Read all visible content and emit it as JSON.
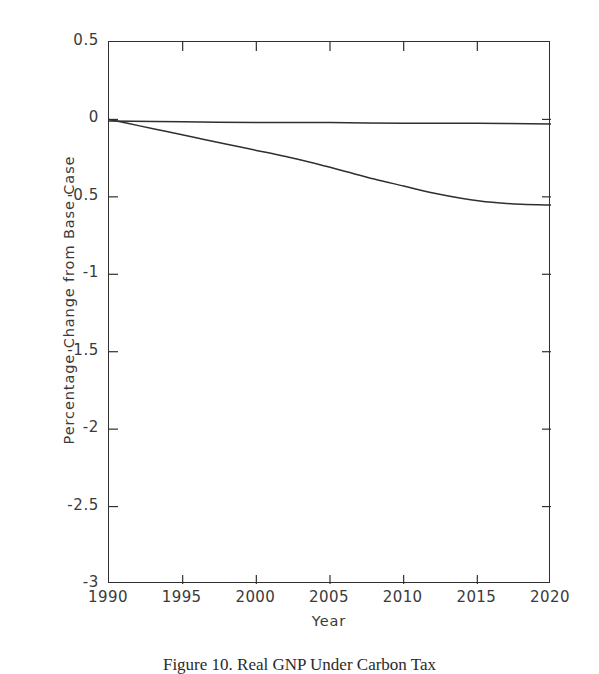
{
  "figure": {
    "caption": "Figure 10.  Real GNP Under Carbon Tax"
  },
  "axes": {
    "xlabel": "Year",
    "ylabel": "Percentage Change from Base Case",
    "xticks": [
      "1990",
      "1995",
      "2000",
      "2005",
      "2010",
      "2015",
      "2020"
    ],
    "yticks": [
      "0.5",
      "0",
      "-0.5",
      "-1",
      "-1.5",
      "-2",
      "-2.5",
      "-3"
    ]
  },
  "chart_data": {
    "type": "line",
    "title": "",
    "xlabel": "Year",
    "ylabel": "Percentage Change from Base Case",
    "xlim": [
      1990,
      2020
    ],
    "ylim": [
      -3,
      0.5
    ],
    "xticks": [
      1990,
      1995,
      2000,
      2005,
      2010,
      2015,
      2020
    ],
    "yticks": [
      0.5,
      0,
      -0.5,
      -1,
      -1.5,
      -2,
      -2.5,
      -3
    ],
    "grid": false,
    "legend": "none",
    "tick_direction": "in",
    "frame": "box",
    "series": [
      {
        "name": "Baseline reference",
        "color": "#2f2f2f",
        "x": [
          1990,
          1995,
          2000,
          2005,
          2010,
          2015,
          2020
        ],
        "values": [
          -0.01,
          -0.015,
          -0.02,
          -0.02,
          -0.025,
          -0.025,
          -0.03
        ]
      },
      {
        "name": "Real GNP change",
        "color": "#2f2f2f",
        "x": [
          1990,
          1992,
          1994,
          1996,
          1998,
          2000,
          2002,
          2004,
          2006,
          2008,
          2010,
          2012,
          2014,
          2016,
          2018,
          2020
        ],
        "values": [
          0.0,
          -0.04,
          -0.08,
          -0.12,
          -0.16,
          -0.2,
          -0.24,
          -0.285,
          -0.335,
          -0.385,
          -0.43,
          -0.475,
          -0.51,
          -0.535,
          -0.548,
          -0.553
        ]
      }
    ]
  }
}
